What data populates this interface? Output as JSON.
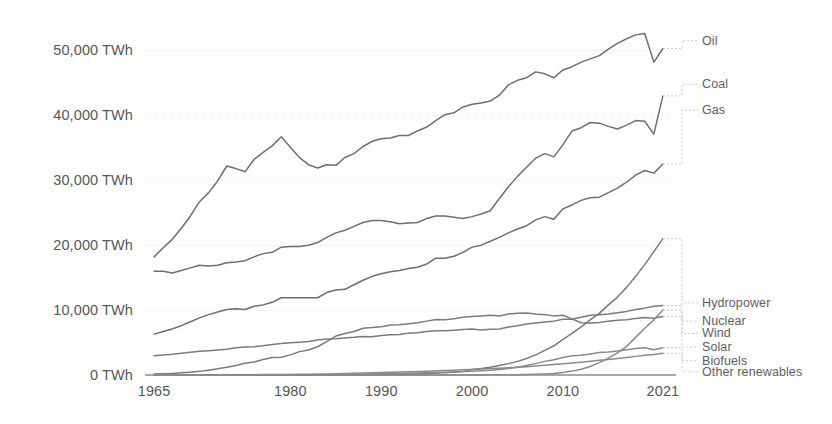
{
  "chart_data": {
    "type": "line",
    "title": "",
    "subtitle": "",
    "xlabel": "",
    "ylabel": "",
    "unit": "TWh",
    "grid": true,
    "legend_position": "right-inline-labels",
    "xlim": [
      1964,
      2022
    ],
    "ylim": [
      0,
      55000
    ],
    "xticks": [
      "1965",
      "1980",
      "1990",
      "2000",
      "2010",
      "2021"
    ],
    "xtick_values": [
      1965,
      1980,
      1990,
      2000,
      2010,
      2021
    ],
    "yticks": [
      "0 TWh",
      "10,000 TWh",
      "20,000 TWh",
      "30,000 TWh",
      "40,000 TWh",
      "50,000 TWh"
    ],
    "ytick_values": [
      0,
      10000,
      20000,
      30000,
      40000,
      50000
    ],
    "x": [
      1965,
      1966,
      1967,
      1968,
      1969,
      1970,
      1971,
      1972,
      1973,
      1974,
      1975,
      1976,
      1977,
      1978,
      1979,
      1980,
      1981,
      1982,
      1983,
      1984,
      1985,
      1986,
      1987,
      1988,
      1989,
      1990,
      1991,
      1992,
      1993,
      1994,
      1995,
      1996,
      1997,
      1998,
      1999,
      2000,
      2001,
      2002,
      2003,
      2004,
      2005,
      2006,
      2007,
      2008,
      2009,
      2010,
      2011,
      2012,
      2013,
      2014,
      2015,
      2016,
      2017,
      2018,
      2019,
      2020,
      2021
    ],
    "series": [
      {
        "name": "Oil",
        "color": "#6e6e6e",
        "label_y_value": 51500,
        "values": [
          18200,
          19600,
          20900,
          22600,
          24500,
          26700,
          28100,
          29900,
          32200,
          31800,
          31300,
          33200,
          34300,
          35300,
          36700,
          35100,
          33500,
          32400,
          31900,
          32400,
          32300,
          33500,
          34100,
          35200,
          36000,
          36400,
          36500,
          36900,
          36900,
          37600,
          38200,
          39200,
          40100,
          40400,
          41300,
          41700,
          41900,
          42200,
          43100,
          44700,
          45400,
          45800,
          46700,
          46400,
          45800,
          47000,
          47500,
          48200,
          48700,
          49200,
          50200,
          51100,
          51800,
          52400,
          52600,
          48200,
          50300
        ]
      },
      {
        "name": "Coal",
        "color": "#6e6e6e",
        "label_y_value": 44800,
        "values": [
          16000,
          16000,
          15700,
          16100,
          16500,
          16900,
          16800,
          16900,
          17300,
          17400,
          17600,
          18200,
          18700,
          18900,
          19700,
          19800,
          19800,
          20000,
          20400,
          21200,
          21900,
          22300,
          22900,
          23500,
          23800,
          23800,
          23600,
          23300,
          23400,
          23500,
          24100,
          24500,
          24500,
          24300,
          24100,
          24400,
          24800,
          25300,
          27200,
          29000,
          30600,
          32000,
          33400,
          34100,
          33600,
          35500,
          37600,
          38100,
          38900,
          38800,
          38300,
          37900,
          38500,
          39200,
          39100,
          37100,
          43000
        ]
      },
      {
        "name": "Gas",
        "color": "#6e6e6e",
        "label_y_value": 40800,
        "values": [
          6300,
          6700,
          7100,
          7600,
          8200,
          8800,
          9300,
          9700,
          10100,
          10200,
          10100,
          10600,
          10800,
          11200,
          11900,
          11900,
          11900,
          11900,
          11900,
          12700,
          13100,
          13200,
          13900,
          14600,
          15200,
          15600,
          15900,
          16100,
          16400,
          16600,
          17100,
          18000,
          18000,
          18300,
          18900,
          19700,
          20000,
          20600,
          21200,
          21900,
          22500,
          23000,
          23900,
          24400,
          24000,
          25600,
          26200,
          26900,
          27300,
          27400,
          28100,
          28800,
          29700,
          30800,
          31500,
          31100,
          32500
        ]
      },
      {
        "name": "Hydropower",
        "color": "#7a7a7a",
        "label_y_value": 11100,
        "values": [
          2980,
          3100,
          3200,
          3350,
          3500,
          3650,
          3750,
          3850,
          3950,
          4200,
          4300,
          4350,
          4500,
          4700,
          4850,
          4950,
          5050,
          5150,
          5400,
          5550,
          5600,
          5700,
          5800,
          5950,
          5900,
          6100,
          6200,
          6250,
          6450,
          6500,
          6700,
          6800,
          6800,
          6900,
          7000,
          7100,
          6950,
          7050,
          7100,
          7400,
          7600,
          7850,
          8000,
          8150,
          8300,
          8600,
          8600,
          8900,
          9200,
          9300,
          9400,
          9600,
          9800,
          10100,
          10300,
          10600,
          10700
        ]
      },
      {
        "name": "Nuclear",
        "color": "#7a7a7a",
        "label_y_value": 8300,
        "values": [
          150,
          200,
          250,
          330,
          430,
          560,
          740,
          950,
          1180,
          1450,
          1800,
          2000,
          2400,
          2700,
          2750,
          3100,
          3600,
          3850,
          4350,
          5150,
          6000,
          6400,
          6700,
          7200,
          7300,
          7450,
          7700,
          7750,
          7900,
          8050,
          8300,
          8550,
          8500,
          8650,
          8900,
          9000,
          9100,
          9200,
          9100,
          9400,
          9500,
          9550,
          9400,
          9300,
          9100,
          9200,
          8650,
          8050,
          8000,
          8100,
          8300,
          8450,
          8500,
          8700,
          8850,
          8750,
          9000
        ]
      },
      {
        "name": "Wind",
        "color": "#7a7a7a",
        "label_y_value": 6400,
        "values": [
          0,
          0,
          0,
          0,
          0,
          0,
          0,
          0,
          0,
          0,
          0,
          0,
          0,
          0,
          0,
          0,
          5,
          8,
          12,
          18,
          25,
          33,
          42,
          55,
          70,
          90,
          110,
          130,
          160,
          200,
          240,
          290,
          350,
          430,
          520,
          840,
          1000,
          1200,
          1450,
          1750,
          2100,
          2550,
          3100,
          3800,
          4500,
          5500,
          6400,
          7400,
          8500,
          9500,
          10800,
          12000,
          13500,
          15200,
          17000,
          19000,
          21000
        ]
      },
      {
        "name": "Solar",
        "color": "#8a8a8a",
        "label_y_value": 4300,
        "values": [
          0,
          0,
          0,
          0,
          0,
          0,
          0,
          0,
          0,
          0,
          0,
          0,
          0,
          0,
          0,
          0,
          0,
          0,
          0,
          0,
          0,
          0,
          0,
          0,
          0,
          1,
          1,
          2,
          3,
          4,
          5,
          6,
          8,
          10,
          12,
          15,
          18,
          22,
          28,
          38,
          50,
          70,
          100,
          160,
          250,
          380,
          600,
          900,
          1300,
          1900,
          2600,
          3400,
          4400,
          5800,
          7200,
          8500,
          10000
        ]
      },
      {
        "name": "Biofuels",
        "color": "#8a8a8a",
        "label_y_value": 2200,
        "values": [
          0,
          0,
          0,
          0,
          0,
          0,
          0,
          0,
          0,
          0,
          0,
          0,
          0,
          0,
          0,
          0,
          5,
          10,
          20,
          35,
          55,
          75,
          95,
          120,
          150,
          180,
          210,
          240,
          270,
          300,
          340,
          380,
          420,
          470,
          520,
          580,
          650,
          740,
          860,
          1000,
          1200,
          1450,
          1750,
          2100,
          2350,
          2700,
          2950,
          3050,
          3250,
          3450,
          3550,
          3700,
          3900,
          4100,
          4200,
          3900,
          4200
        ]
      },
      {
        "name": "Other renewables",
        "color": "#8a8a8a",
        "label_y_value": 500,
        "values": [
          10,
          12,
          14,
          16,
          18,
          20,
          24,
          28,
          32,
          38,
          45,
          52,
          60,
          70,
          80,
          95,
          110,
          125,
          145,
          170,
          200,
          230,
          265,
          300,
          340,
          380,
          420,
          460,
          500,
          545,
          590,
          640,
          690,
          745,
          800,
          860,
          920,
          985,
          1050,
          1120,
          1200,
          1290,
          1390,
          1500,
          1600,
          1720,
          1850,
          1980,
          2120,
          2260,
          2400,
          2550,
          2700,
          2870,
          3040,
          3150,
          3350
        ]
      }
    ],
    "legend_labels_top": [
      "Oil",
      "Coal",
      "Gas"
    ],
    "legend_labels_bottom": [
      "Hydropower",
      "Nuclear",
      "Wind",
      "Solar",
      "Biofuels",
      "Other renewables"
    ]
  },
  "axis": {
    "baseline_color": "#8c8c8c",
    "gridline_color": "#dcdcdc",
    "tick_text_color": "#575757"
  }
}
